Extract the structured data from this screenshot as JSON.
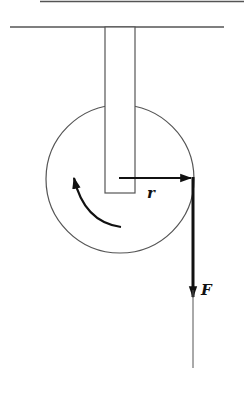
{
  "diagram": {
    "type": "physics-pulley-torque",
    "labels": {
      "radius": "r",
      "force": "F"
    },
    "colors": {
      "line": "#555555",
      "arrow": "#111111",
      "background": "#ffffff"
    },
    "elements": [
      {
        "name": "top-bar",
        "kind": "line"
      },
      {
        "name": "ceiling",
        "kind": "line"
      },
      {
        "name": "support-rod",
        "kind": "rectangle"
      },
      {
        "name": "pulley-wheel",
        "kind": "circle"
      },
      {
        "name": "radius-arrow",
        "kind": "arrow",
        "label": "r"
      },
      {
        "name": "force-arrow",
        "kind": "arrow",
        "label": "F",
        "direction": "down"
      },
      {
        "name": "rotation-arrow",
        "kind": "curved-arrow",
        "direction": "clockwise"
      },
      {
        "name": "rope",
        "kind": "line"
      }
    ]
  }
}
